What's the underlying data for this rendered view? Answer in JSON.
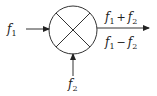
{
  "diagram": {
    "type": "mixer-block",
    "inputs": [
      {
        "symbol": "f",
        "subscript": "1",
        "direction": "left"
      },
      {
        "symbol": "f",
        "subscript": "2",
        "direction": "bottom"
      }
    ],
    "outputs": {
      "upper": {
        "a": "f",
        "a_sub": "1",
        "op": "+",
        "b": "f",
        "b_sub": "2"
      },
      "lower": {
        "a": "f",
        "a_sub": "1",
        "op": "−",
        "b": "f",
        "b_sub": "2"
      }
    },
    "stroke_color": "#333333"
  }
}
